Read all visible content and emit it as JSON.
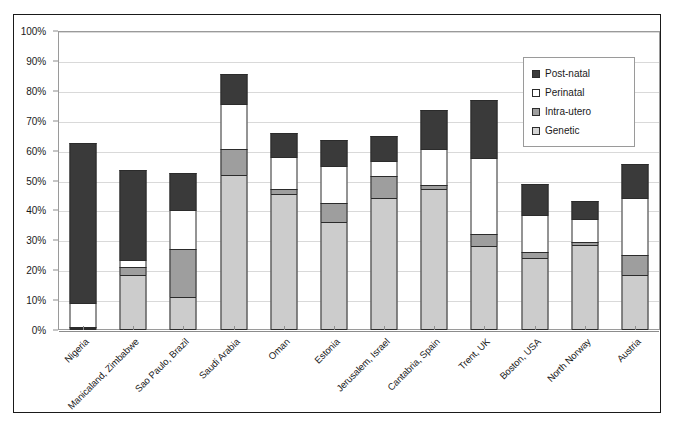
{
  "chart_data": {
    "type": "bar",
    "subtype": "stacked-percent",
    "title": "",
    "xlabel": "",
    "ylabel": "",
    "ylim": [
      0,
      100
    ],
    "ytick_labels": [
      "0%",
      "10%",
      "20%",
      "30%",
      "40%",
      "50%",
      "60%",
      "70%",
      "80%",
      "90%",
      "100%"
    ],
    "ytick_values": [
      0,
      10,
      20,
      30,
      40,
      50,
      60,
      70,
      80,
      90,
      100
    ],
    "grid": true,
    "legend_position": "top-right",
    "categories": [
      "Nigeria",
      "Manicaland, Zimbabwe",
      "Sao Paulo, Brazil",
      "Saudi Arabia",
      "Oman",
      "Estonia",
      "Jerusalem, Israel",
      "Cantabria, Spain",
      "Trent, UK",
      "Boston, USA",
      "North Norway",
      "Austria"
    ],
    "series": [
      {
        "name": "Genetic",
        "color": "#cccccc",
        "values": [
          0.5,
          18.5,
          11.0,
          52.0,
          45.5,
          36.0,
          44.0,
          47.0,
          28.0,
          24.0,
          28.5,
          18.5
        ]
      },
      {
        "name": "Intra-utero",
        "color": "#9e9e9e",
        "values": [
          0.5,
          2.5,
          16.0,
          8.5,
          1.5,
          6.5,
          7.5,
          1.5,
          4.0,
          2.0,
          1.0,
          6.5
        ]
      },
      {
        "name": "Perinatal",
        "color": "#ffffff",
        "values": [
          8.0,
          2.5,
          13.0,
          15.0,
          11.0,
          12.5,
          5.0,
          12.0,
          25.5,
          12.5,
          7.5,
          19.0
        ]
      },
      {
        "name": "Post-natal",
        "color": "#3a3a3a",
        "values": [
          53.5,
          30.0,
          12.5,
          10.0,
          8.0,
          8.5,
          8.5,
          13.0,
          19.5,
          10.5,
          6.0,
          11.5
        ]
      }
    ],
    "totals": [
      62.5,
      53.5,
      52.5,
      85.5,
      66.0,
      63.5,
      65.0,
      73.5,
      77.0,
      49.0,
      43.0,
      55.5
    ]
  },
  "legend": {
    "items": [
      {
        "label": "Post-natal",
        "swatch": "postnatal"
      },
      {
        "label": "Perinatal",
        "swatch": "perinatal"
      },
      {
        "label": "Intra-utero",
        "swatch": "intrautero"
      },
      {
        "label": "Genetic",
        "swatch": "genetic"
      }
    ]
  },
  "colors": {
    "postnatal": "#3a3a3a",
    "perinatal": "#ffffff",
    "intrautero": "#9e9e9e",
    "genetic": "#cccccc",
    "grid": "#d9d9d9",
    "axis": "#8c8c8c",
    "frame": "#1a1a1a"
  }
}
